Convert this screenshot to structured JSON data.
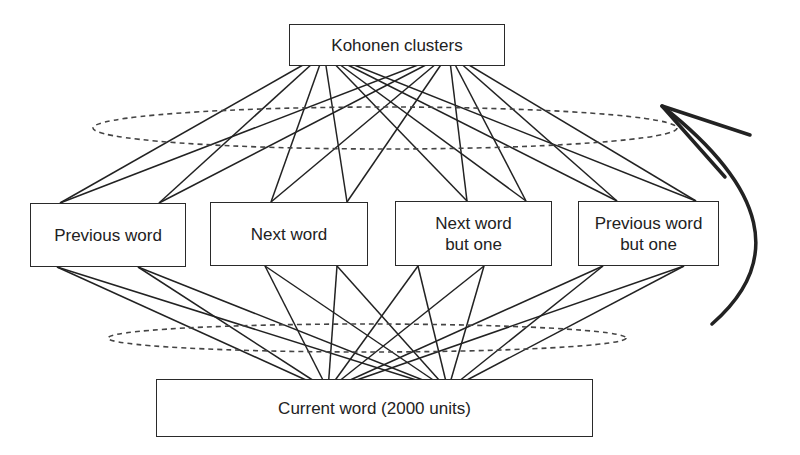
{
  "diagram": {
    "type": "network-architecture",
    "nodes": {
      "top": {
        "id": "kohonen",
        "label": "Kohonen clusters",
        "box": [
          289,
          24,
          216,
          42
        ]
      },
      "middle": [
        {
          "id": "prev",
          "lines": [
            "Previous word"
          ],
          "box": [
            30,
            203,
            156,
            64
          ]
        },
        {
          "id": "next",
          "lines": [
            "Next word"
          ],
          "box": [
            210,
            202,
            158,
            64
          ]
        },
        {
          "id": "next2",
          "lines": [
            "Next word",
            "but one"
          ],
          "box": [
            395,
            201,
            157,
            65
          ]
        },
        {
          "id": "prev2",
          "lines": [
            "Previous word",
            "but one"
          ],
          "box": [
            578,
            201,
            141,
            65
          ]
        }
      ],
      "bottom": {
        "id": "current",
        "label": "Current word (2000 units)",
        "box": [
          156,
          379,
          437,
          58
        ]
      }
    },
    "upper_connections": {
      "apexes": [
        [
          324,
          53
        ],
        [
          449,
          53
        ]
      ],
      "endpoints": [
        [
          60,
          203
        ],
        [
          159,
          203
        ],
        [
          271,
          202
        ],
        [
          347,
          202
        ],
        [
          467,
          201
        ],
        [
          526,
          201
        ],
        [
          617,
          201
        ],
        [
          696,
          201
        ]
      ]
    },
    "lower_connections": {
      "apexes": [
        [
          328,
          390
        ],
        [
          448,
          390
        ]
      ],
      "endpoints": [
        [
          57,
          267
        ],
        [
          138,
          267
        ],
        [
          265,
          266
        ],
        [
          337,
          266
        ],
        [
          418,
          266
        ],
        [
          484,
          266
        ],
        [
          603,
          266
        ],
        [
          684,
          266
        ]
      ]
    },
    "ellipses": [
      {
        "name": "upper-group-ellipse",
        "cx": 385,
        "cy": 128,
        "rx": 292,
        "ry": 21
      },
      {
        "name": "lower-group-ellipse",
        "cx": 367,
        "cy": 338,
        "rx": 259,
        "ry": 14
      }
    ],
    "feedback_arrow": {
      "path": "M 712 324 Q 820 230 662 106",
      "head": [
        [
          662,
          106
        ],
        [
          750,
          135
        ],
        [
          662,
          106
        ],
        [
          725,
          177
        ]
      ]
    },
    "colors": {
      "stroke": "#222222",
      "dashed": "#444444",
      "background": "#ffffff"
    }
  }
}
